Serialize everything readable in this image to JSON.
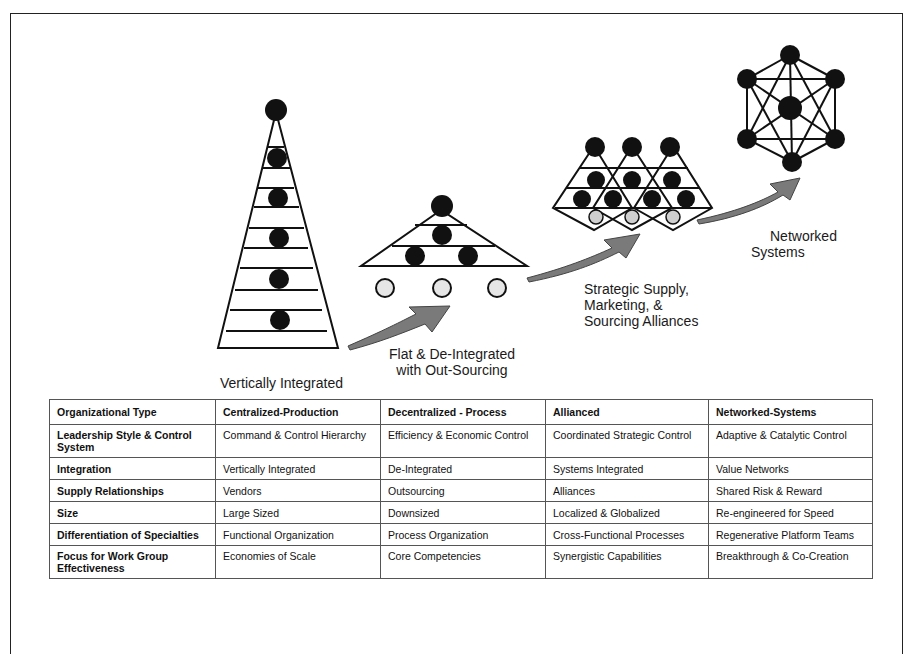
{
  "diagram": {
    "stages": [
      {
        "id": "vertical",
        "label": "Vertically Integrated"
      },
      {
        "id": "flat",
        "label_lines": [
          "Flat & De-Integrated",
          "with Out-Sourcing"
        ]
      },
      {
        "id": "alliances",
        "label_lines": [
          "Strategic Supply,",
          "Marketing, &",
          "Sourcing Alliances"
        ]
      },
      {
        "id": "networked",
        "label_lines": [
          "Networked",
          "Systems"
        ]
      }
    ],
    "colors": {
      "node_fill": "#111111",
      "outsource_node_fill": "#e6e6e6",
      "arrow_fill": "#7a7a7a",
      "line": "#111111"
    }
  },
  "table": {
    "headers": [
      "Organizational Type",
      "Centralized-Production",
      "Decentralized - Process",
      "Allianced",
      "Networked-Systems"
    ],
    "rows": [
      {
        "label": "Leadership Style & Control System",
        "values": [
          "Command & Control Hierarchy",
          "Efficiency & Economic Control",
          "Coordinated Strategic Control",
          "Adaptive & Catalytic Control"
        ]
      },
      {
        "label": "Integration",
        "values": [
          "Vertically Integrated",
          "De-Integrated",
          "Systems Integrated",
          "Value Networks"
        ]
      },
      {
        "label": "Supply Relationships",
        "values": [
          "Vendors",
          "Outsourcing",
          "Alliances",
          "Shared Risk & Reward"
        ]
      },
      {
        "label": "Size",
        "values": [
          "Large Sized",
          "Downsized",
          "Localized & Globalized",
          "Re-engineered for Speed"
        ]
      },
      {
        "label": "Differentiation of Specialties",
        "values": [
          "Functional Organization",
          "Process Organization",
          "Cross-Functional Processes",
          "Regenerative Platform Teams"
        ]
      },
      {
        "label": "Focus for Work Group Effectiveness",
        "values": [
          "Economies of Scale",
          "Core Competencies",
          "Synergistic Capabilities",
          "Breakthrough & Co-Creation"
        ]
      }
    ]
  }
}
